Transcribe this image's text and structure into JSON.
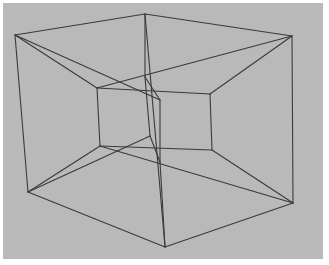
{
  "figure": {
    "subject": "Wireframe projection of a hypercube (tesseract): an outer cube, an inner cube, and connecting edges",
    "background_color": "#b9b9b9",
    "border_color": "#ffffff",
    "line_color": "#3a3a3a"
  },
  "diagram": {
    "vertices": {
      "outer_top_left": [
        15,
        35
      ],
      "outer_top_back": [
        145,
        14
      ],
      "outer_top_right": [
        292,
        36
      ],
      "outer_bottom_left": [
        28,
        192
      ],
      "outer_bottom_right": [
        293,
        203
      ],
      "outer_bottom_front": [
        165,
        247
      ],
      "inner_top_left": [
        97,
        88
      ],
      "inner_top_right": [
        210,
        94
      ],
      "inner_bottom_left": [
        100,
        146
      ],
      "inner_bottom_right": [
        212,
        150
      ],
      "inner_top_back": [
        145,
        77
      ],
      "inner_top_front": [
        160,
        100
      ],
      "inner_bottom_back": [
        150,
        136
      ],
      "inner_bottom_front": [
        160,
        162
      ]
    },
    "edges": [
      [
        "outer_top_left",
        "outer_top_back"
      ],
      [
        "outer_top_back",
        "outer_top_right"
      ],
      [
        "outer_top_left",
        "outer_bottom_left"
      ],
      [
        "outer_top_right",
        "outer_bottom_right"
      ],
      [
        "outer_bottom_left",
        "outer_bottom_front"
      ],
      [
        "outer_bottom_front",
        "outer_bottom_right"
      ],
      [
        "outer_top_back",
        "outer_bottom_front"
      ],
      [
        "outer_top_left",
        "inner_top_left"
      ],
      [
        "outer_top_left",
        "inner_top_front"
      ],
      [
        "outer_top_right",
        "inner_top_right"
      ],
      [
        "outer_top_right",
        "inner_top_left"
      ],
      [
        "outer_bottom_left",
        "inner_bottom_left"
      ],
      [
        "outer_bottom_left",
        "inner_bottom_back"
      ],
      [
        "outer_bottom_right",
        "inner_bottom_right"
      ],
      [
        "outer_bottom_right",
        "inner_bottom_left"
      ],
      [
        "inner_top_left",
        "inner_top_right"
      ],
      [
        "inner_bottom_left",
        "inner_bottom_right"
      ],
      [
        "inner_top_left",
        "inner_bottom_left"
      ],
      [
        "inner_top_right",
        "inner_bottom_right"
      ],
      [
        "inner_top_back",
        "inner_top_front"
      ],
      [
        "inner_bottom_back",
        "inner_bottom_front"
      ],
      [
        "outer_top_back",
        "inner_top_back"
      ],
      [
        "inner_top_back",
        "inner_bottom_back"
      ],
      [
        "inner_top_front",
        "inner_bottom_front"
      ],
      [
        "inner_bottom_front",
        "outer_bottom_front"
      ]
    ]
  }
}
